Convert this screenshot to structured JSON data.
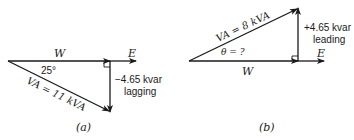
{
  "diagram_a": {
    "caption": "(a)",
    "w_label": "W",
    "e_label": "E",
    "angle_label": "25°",
    "va_label": "VA = 11 kVA",
    "kvar_line1": "−4.65 kvar",
    "kvar_line2": "lagging"
  },
  "diagram_b": {
    "caption": "(b)",
    "w_label": "W",
    "e_label": "E",
    "angle_label": "θ = ?",
    "va_label": "VA = 8 kVA",
    "kvar_line1": "+4.65 kvar",
    "kvar_line2": "leading"
  },
  "colors": {
    "ink": "#1a1a1a",
    "background": "#ffffff"
  }
}
